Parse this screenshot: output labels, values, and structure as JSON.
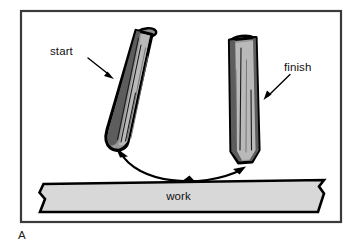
{
  "figure": {
    "panel_id": "A",
    "caption_labels": {
      "start": "start",
      "finish": "finish",
      "work": "work"
    },
    "colors": {
      "frame_border": "#3a3a3a",
      "panel_background": "#ffffff",
      "tool_fill": "#9a9a9a",
      "tool_outline": "#000000",
      "tool_highlight": "#b9b9b9",
      "tool_shade": "#5d5d5d",
      "work_fill": "#d8d8d8",
      "work_outline": "#000000",
      "arrow": "#000000",
      "text": "#111111"
    },
    "icons": {
      "start_leader": "leader-arrow-icon",
      "finish_leader": "leader-arrow-icon",
      "motion": "curved-double-arrow-icon"
    }
  }
}
